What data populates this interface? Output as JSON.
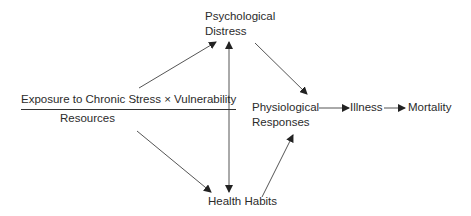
{
  "diagram": {
    "nodes": {
      "psych_distress": {
        "line1": "Psychological",
        "line2": "Distress"
      },
      "exposure": {
        "numerator": "Exposure to Chronic Stress × Vulnerability",
        "denominator": "Resources"
      },
      "physio_responses": {
        "line1": "Physiological",
        "line2": "Responses"
      },
      "illness": {
        "label": "Illness"
      },
      "mortality": {
        "label": "Mortality"
      },
      "health_habits": {
        "label": "Health Habits"
      }
    },
    "edges": [
      {
        "from": "exposure",
        "to": "psych_distress"
      },
      {
        "from": "exposure",
        "to": "health_habits"
      },
      {
        "from": "psych_distress",
        "to": "health_habits",
        "bidirectional": true
      },
      {
        "from": "psych_distress",
        "to": "physio_responses"
      },
      {
        "from": "health_habits",
        "to": "physio_responses"
      },
      {
        "from": "physio_responses",
        "to": "illness"
      },
      {
        "from": "illness",
        "to": "mortality"
      }
    ],
    "colors": {
      "line": "#555555",
      "text": "#2b2b2b"
    }
  }
}
